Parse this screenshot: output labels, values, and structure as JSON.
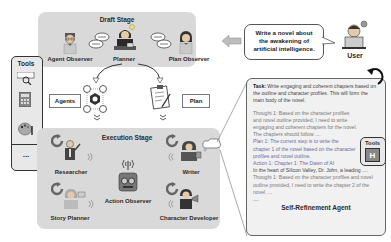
{
  "draft_stage": {
    "title": "Draft Stage",
    "agents": [
      {
        "label": "Agent Observer",
        "icon": "agent-observer-icon"
      },
      {
        "label": "Planner",
        "icon": "planner-icon"
      },
      {
        "label": "Plan Observer",
        "icon": "plan-observer-icon"
      }
    ]
  },
  "user": {
    "label": "User",
    "prompt": "Write a novel about the awakening of artificial intelligence."
  },
  "tools_left": {
    "title": "Tools",
    "items": [
      "image-search-icon",
      "calculator-icon",
      "palette-icon"
    ],
    "more": "..."
  },
  "outputs": {
    "agents_label": "Agents",
    "plan_label": "Plan"
  },
  "execution_stage": {
    "title": "Execution Stage",
    "agents": [
      {
        "label": "Researcher"
      },
      {
        "label": "Writer"
      },
      {
        "label": "Action Observer"
      },
      {
        "label": "Story Planner"
      },
      {
        "label": "Character Developer"
      }
    ]
  },
  "self_refinement": {
    "title": "Self-Refinement Agent",
    "task_key": "Task:",
    "task_text": "Write engaging and coherent chapters based on the outline and character profiles. This will form the main body of the novel.",
    "thought1": "Thought 1: Based on the character profiles and novel outline provided, I need to write engaging and coherent chapters for the novel. The chapters should follow ....",
    "plan1": "Plan 1: The current step is to write the chapter 1 of the novel based on the character profiles and novel outline.",
    "action1": "Action 1: Chapter 1: The Dawn of AI",
    "action1_cont": "In the heart of Silicon Valley, Dr. John, a leading ....",
    "thought2": "Thought 1: Based on the character profiles and novel outline provided, I need to write the chapter 2 of the novel ....",
    "ellipsis": "....",
    "tools_title": "Tools",
    "tools_icon": "H"
  }
}
